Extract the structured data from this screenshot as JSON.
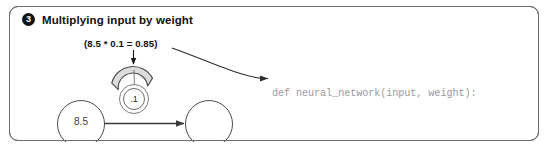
{
  "panel": {
    "step_number": "3",
    "title": "Multiplying input by weight",
    "border_color": "#6e6e70"
  },
  "diagram": {
    "formula_label": "(8.5 * 0.1 = 0.85)",
    "input_node_value": "8.5",
    "output_node_value": "",
    "weight_knob_value": ".1",
    "gauge_fill_color": "#dcdcdc",
    "gauge_stroke_color": "#4a4a4c",
    "arrow_color": "#3a3a3c"
  },
  "code": {
    "line_1": "def neural_network(input, weight):",
    "line_2": "prediction = input * weight",
    "line_3": "return prediction",
    "muted_color": "#9a9a9d",
    "highlight_color": "#121214"
  }
}
